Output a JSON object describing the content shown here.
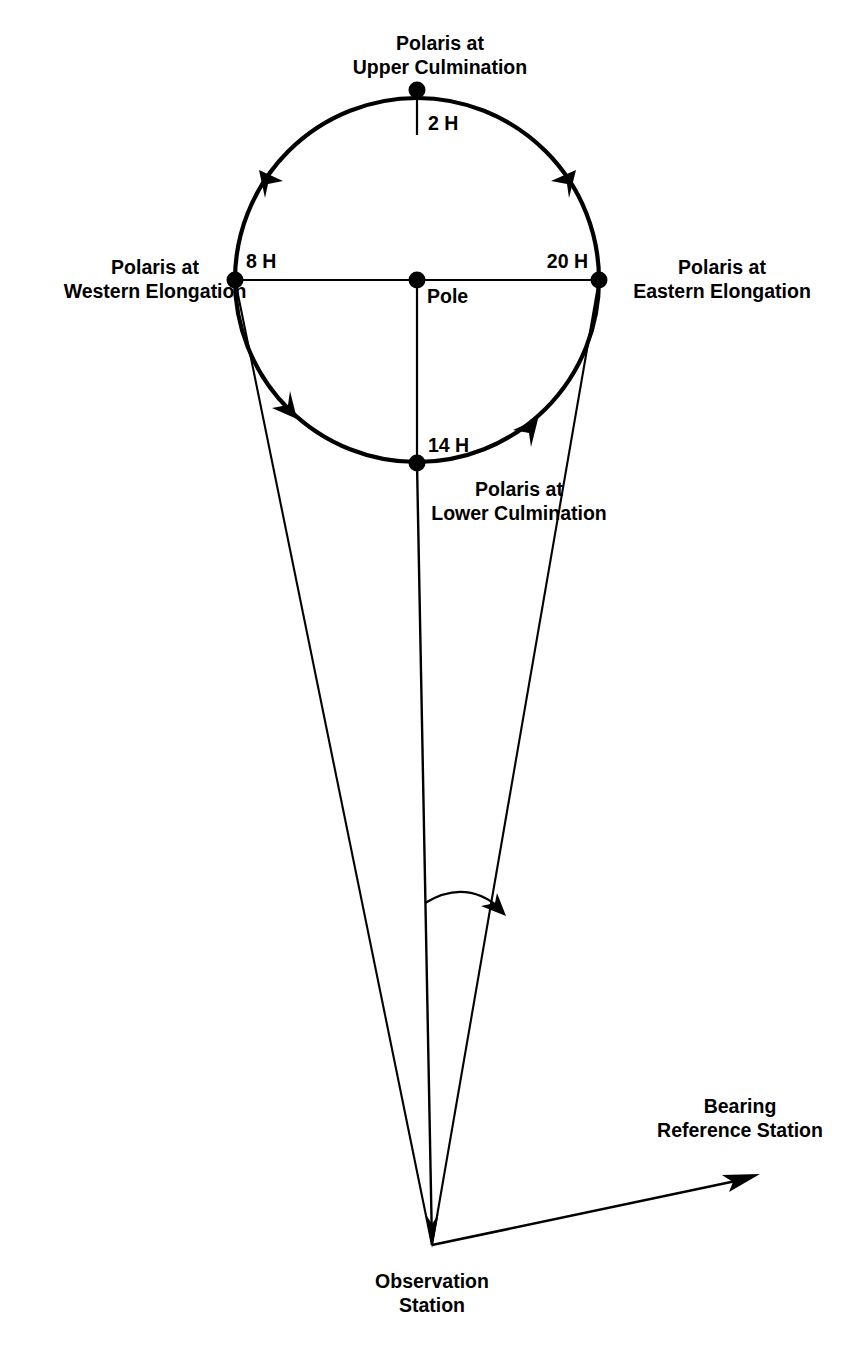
{
  "figure": {
    "background_color": "#ffffff",
    "stroke_color": "#000000"
  },
  "labels": {
    "upper_culmination_line1": "Polaris at",
    "upper_culmination_line2": "Upper Culmination",
    "western_elongation_line1": "Polaris at",
    "western_elongation_line2": "Western Elongation",
    "eastern_elongation_line1": "Polaris at",
    "eastern_elongation_line2": "Eastern Elongation",
    "lower_culmination_line1": "Polaris at",
    "lower_culmination_line2": "Lower Culmination",
    "pole": "Pole",
    "observation_station_line1": "Observation",
    "observation_station_line2": "Station",
    "bearing_reference_line1": "Bearing",
    "bearing_reference_line2": "Reference Station"
  },
  "hour_marks": {
    "upper_culmination": "2 H",
    "western_elongation": "8 H",
    "lower_culmination": "14 H",
    "eastern_elongation": "20 H"
  },
  "geometry": {
    "circle_center_x": 417,
    "circle_center_y": 280,
    "circle_radius": 182,
    "observation_station_x": 432,
    "observation_station_y": 1245,
    "bearing_arrow_tip_x": 757,
    "bearing_arrow_tip_y": 1176,
    "rotation_direction": "counter-clockwise"
  }
}
